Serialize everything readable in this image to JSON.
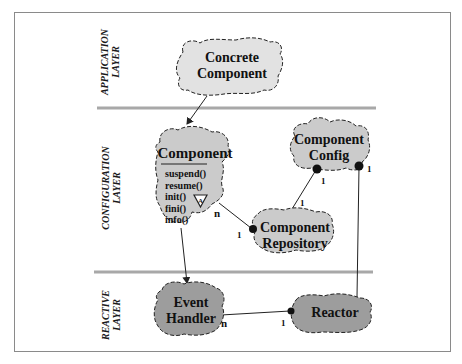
{
  "diagram": {
    "type": "layered class diagram (cloud notation)",
    "colors": {
      "frame_border": "#8a8a8a",
      "separator": "#a8a8a8",
      "application_fill": "#e2e2e2",
      "configuration_fill": "#cbcbcb",
      "reactive_fill": "#9d9d9d",
      "outline": "#222222"
    },
    "layers": [
      {
        "id": "application",
        "label_line1": "APPLICATION",
        "label_line2": "LAYER"
      },
      {
        "id": "configuration",
        "label_line1": "CONFIGURATION",
        "label_line2": "LAYER"
      },
      {
        "id": "reactive",
        "label_line1": "REACTIVE",
        "label_line2": "LAYER"
      }
    ],
    "nodes": {
      "concrete_component": {
        "line1": "Concrete",
        "line2": "Component",
        "layer": "application"
      },
      "component": {
        "title": "Component",
        "layer": "configuration",
        "methods": [
          "suspend()",
          "resume()",
          "init()",
          "fini()",
          "info()"
        ],
        "abstract_marker": "A"
      },
      "component_config": {
        "line1": "Component",
        "line2": "Config",
        "layer": "configuration"
      },
      "component_repository": {
        "line1": "Component",
        "line2": "Repository",
        "layer": "configuration"
      },
      "event_handler": {
        "line1": "Event",
        "line2": "Handler",
        "layer": "reactive"
      },
      "reactor": {
        "line1": "Reactor",
        "layer": "reactive"
      }
    },
    "relationships": [
      {
        "from": "concrete_component",
        "to": "component",
        "kind": "inheritance-arrow"
      },
      {
        "from": "component",
        "to": "event_handler",
        "kind": "inheritance-arrow"
      },
      {
        "from": "component",
        "to": "component_repository",
        "kind": "association",
        "from_mult": "n",
        "to_mult": "1"
      },
      {
        "from": "component_repository",
        "to": "component_config",
        "kind": "association",
        "from_mult": "1",
        "to_mult": "1"
      },
      {
        "from": "reactor",
        "to": "component_config",
        "kind": "association",
        "from_mult": "",
        "to_mult": "1"
      },
      {
        "from": "event_handler",
        "to": "reactor",
        "kind": "association",
        "from_mult": "n",
        "to_mult": "1"
      }
    ],
    "multiplicity_labels": {
      "comp_repo_n": "n",
      "comp_repo_1": "1",
      "repo_config_1a": "1",
      "repo_config_1b": "1",
      "config_reactor_1": "1",
      "eh_reactor_n": "n",
      "eh_reactor_1": "1"
    }
  }
}
